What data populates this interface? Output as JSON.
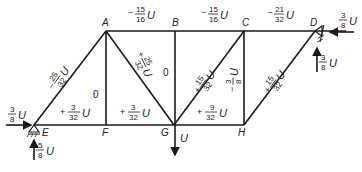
{
  "nodes": {
    "A": "A",
    "B": "B",
    "C": "C",
    "D": "D",
    "E": "E",
    "F": "F",
    "G": "G",
    "H": "H"
  },
  "members": {
    "AB": {
      "sign": "−",
      "num": "15",
      "den": "16",
      "unit": "U"
    },
    "BC": {
      "sign": "−",
      "num": "15",
      "den": "16",
      "unit": "U"
    },
    "CD": {
      "sign": "−",
      "num": "21",
      "den": "32",
      "unit": "U"
    },
    "AE": {
      "sign": "−",
      "num": "25",
      "den": "32",
      "unit": "U"
    },
    "AG": {
      "sign": "+",
      "num": "25",
      "den": "32",
      "unit": "U"
    },
    "AF": {
      "value": "0"
    },
    "BG": {
      "value": "0"
    },
    "CG": {
      "sign": "+",
      "num": "15",
      "den": "32",
      "unit": "U"
    },
    "CH": {
      "sign": "−",
      "num": "3",
      "den": "8",
      "unit": "U"
    },
    "DH": {
      "sign": "+",
      "num": "15",
      "den": "32",
      "unit": "U"
    },
    "EF": {
      "sign": "+",
      "num": "3",
      "den": "32",
      "unit": "U"
    },
    "FG": {
      "sign": "+",
      "num": "3",
      "den": "32",
      "unit": "U"
    },
    "GH": {
      "sign": "+",
      "num": "9",
      "den": "32",
      "unit": "U"
    }
  },
  "loads": {
    "E_horizontal": {
      "num": "3",
      "den": "8",
      "unit": "U"
    },
    "E_vertical": {
      "num": "5",
      "den": "8",
      "unit": "U"
    },
    "D_horizontal": {
      "num": "3",
      "den": "8",
      "unit": "U"
    },
    "D_vertical": {
      "num": "3",
      "den": "8",
      "unit": "U"
    },
    "G_load": {
      "unit": "U"
    }
  },
  "colors": {
    "ink": "#1a1a1a",
    "background": "#ffffff"
  }
}
